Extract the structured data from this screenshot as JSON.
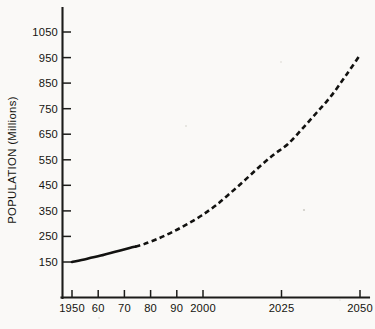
{
  "chart_data": {
    "type": "line",
    "title": "",
    "xlabel": "",
    "ylabel": "POPULATION (Millions)",
    "xlim": [
      1950,
      2050
    ],
    "ylim": [
      100,
      1100
    ],
    "grid": false,
    "legend": null,
    "x_tick_labels": [
      "1950",
      "60",
      "70",
      "80",
      "90",
      "2000",
      "2025",
      "2050"
    ],
    "x_tick_values": [
      1950,
      1960,
      1970,
      1980,
      1990,
      2000,
      2025,
      2050
    ],
    "y_tick_labels": [
      "150",
      "250",
      "350",
      "450",
      "550",
      "650",
      "750",
      "850",
      "950",
      "1050"
    ],
    "y_tick_values": [
      150,
      250,
      350,
      450,
      550,
      650,
      750,
      850,
      950,
      1050
    ],
    "series": [
      {
        "name": "Population",
        "style": "solid",
        "note": "historical",
        "x": [
          1950,
          1955,
          1960,
          1965,
          1970,
          1972
        ],
        "values": [
          150,
          162,
          175,
          190,
          205,
          210
        ]
      },
      {
        "name": "Population (projected)",
        "style": "dashed",
        "note": "projection",
        "x": [
          1972,
          1975,
          1980,
          1985,
          1990,
          1995,
          2000,
          2005,
          2010,
          2015,
          2020,
          2025,
          2030,
          2035,
          2040,
          2045,
          2050
        ],
        "values": [
          210,
          220,
          242,
          268,
          298,
          332,
          372,
          420,
          470,
          522,
          570,
          612,
          672,
          735,
          800,
          878,
          960
        ]
      }
    ],
    "annotations": []
  },
  "axes": {
    "y_axis_label": "POPULATION (Millions)"
  }
}
